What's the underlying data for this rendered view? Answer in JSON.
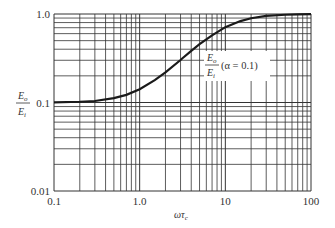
{
  "chart_data": {
    "type": "line",
    "title": "",
    "xlabel": "ωτ_c",
    "ylabel": "E_o / E_i",
    "xscale": "log",
    "yscale": "log",
    "xlim": [
      0.1,
      100
    ],
    "ylim": [
      0.01,
      1.0
    ],
    "grid": true,
    "x_ticks": [
      "0.1",
      "1.0",
      "10",
      "100"
    ],
    "y_ticks": [
      "0.01",
      "0.1",
      "1.0"
    ],
    "series": [
      {
        "name": "E_o/E_i (α = 0.1)",
        "x": [
          0.1,
          0.2,
          0.3,
          0.5,
          0.7,
          1.0,
          1.5,
          2.0,
          3.0,
          3.16,
          4.0,
          5.0,
          7.0,
          10.0,
          15.0,
          20.0,
          30.0,
          50.0,
          70.0,
          100.0
        ],
        "values": [
          0.1005,
          0.102,
          0.104,
          0.112,
          0.122,
          0.141,
          0.179,
          0.219,
          0.302,
          0.316,
          0.384,
          0.456,
          0.573,
          0.711,
          0.832,
          0.895,
          0.951,
          0.981,
          0.99,
          0.995
        ]
      }
    ],
    "annotations": [
      {
        "text": "(α = 0.1)",
        "near_x": 10,
        "near_y": 0.55
      }
    ],
    "legend": "none"
  },
  "labels": {
    "y_num": "E",
    "y_num_sub": "o",
    "y_den": "E",
    "y_den_sub": "i",
    "x_main": "ωτ",
    "x_sub": "c",
    "ann_num": "E",
    "ann_num_sub": "o",
    "ann_den": "E",
    "ann_den_sub": "i",
    "ann_text": "(α = 0.1)"
  },
  "colors": {
    "grid": "#333333",
    "curve": "#1a1a1a",
    "background": "#ffffff"
  }
}
